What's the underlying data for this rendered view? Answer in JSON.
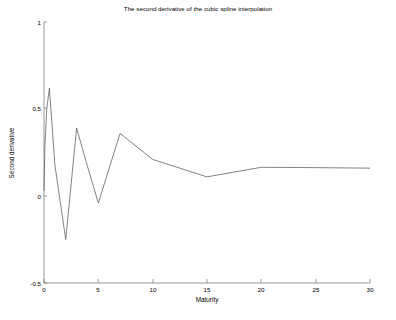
{
  "chart_data": {
    "type": "line",
    "title": "The second derivative of the cubic spline interpolation",
    "xlabel": "Maturity",
    "ylabel": "Second derivative",
    "xlim": [
      0,
      30
    ],
    "ylim": [
      -0.5,
      1
    ],
    "xticks": [
      0,
      5,
      10,
      15,
      20,
      25,
      30
    ],
    "xtick_labels": [
      "0",
      "5",
      "10",
      "15",
      "20",
      "25",
      "30"
    ],
    "yticks": [
      -0.5,
      0,
      0.5,
      1
    ],
    "ytick_labels": [
      "-0.5",
      "0",
      "0.5",
      "1"
    ],
    "grid": false,
    "legend": null,
    "series": [
      {
        "name": "second derivative",
        "color": "#5a5a5a",
        "x": [
          0,
          0.08,
          0.25,
          0.5,
          1,
          2,
          3,
          4,
          5,
          6,
          7,
          10,
          15,
          20,
          25,
          30
        ],
        "y": [
          0.03,
          0.28,
          0.5,
          0.62,
          0.18,
          -0.25,
          0.39,
          0.17,
          -0.04,
          0.16,
          0.36,
          0.21,
          0.11,
          0.165,
          0.163,
          0.16
        ]
      }
    ]
  },
  "figure": {
    "background_color": "#ffffff",
    "line_color": "#5a5a5a",
    "axis_color": "#6e6e6e"
  }
}
